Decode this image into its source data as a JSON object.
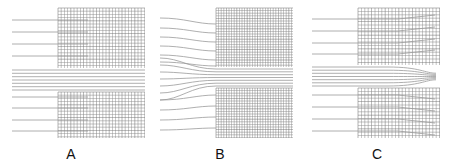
{
  "figure": {
    "panels": [
      {
        "id": "A",
        "label": "A",
        "label_x": 70,
        "grid": {
          "x0": 58,
          "x1": 145,
          "top_y0": 8,
          "top_y1": 68,
          "bot_y0": 92,
          "bot_y1": 138,
          "spacing": 3.2
        },
        "streamline_start_x": 12,
        "flow": "straight"
      },
      {
        "id": "B",
        "label": "B",
        "label_x": 219,
        "grid": {
          "x0": 216,
          "x1": 293,
          "top_y0": 8,
          "top_y1": 67,
          "bot_y0": 88,
          "bot_y1": 138,
          "spacing": 2.6
        },
        "streamline_start_x": 160,
        "flow": "converging-inlet"
      },
      {
        "id": "C",
        "label": "C",
        "label_x": 376,
        "grid": {
          "x0": 358,
          "x1": 440,
          "top_y0": 8,
          "top_y1": 65,
          "bot_y0": 88,
          "bot_y1": 138,
          "spacing": 3.4
        },
        "streamline_start_x": 312,
        "flow": "diverging-outlet"
      }
    ],
    "colors": {
      "grid": "#8a8a8a",
      "grid_dark": "#6e6e6e",
      "streamline": "#9a9a9a",
      "label": "#111111"
    }
  }
}
